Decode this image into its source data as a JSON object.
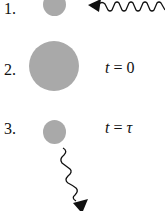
{
  "diagram": {
    "steps": [
      {
        "label": "1.",
        "time_var": "",
        "time_eq": "",
        "time_val": "",
        "description": "atom with incoming photon (wavy line with arrow pointing at atom)"
      },
      {
        "label": "2.",
        "time_var": "t",
        "time_eq": " = ",
        "time_val": "0",
        "description": "enlarged (excited) atom"
      },
      {
        "label": "3.",
        "time_var": "t",
        "time_eq": " = ",
        "time_val": "τ",
        "description": "atom emitting photon (wavy line with arrow pointing away, downward)"
      }
    ],
    "colors": {
      "atom": "#a9a9a9",
      "photon": "#111111",
      "text": "#111111"
    }
  }
}
